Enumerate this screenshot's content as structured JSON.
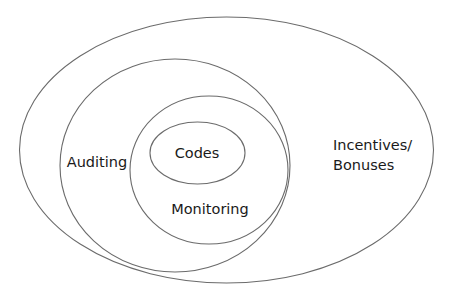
{
  "diagram": {
    "type": "nested-ellipses",
    "layers": [
      {
        "id": "incentives",
        "label_lines": [
          "Incentives/",
          "Bonuses"
        ]
      },
      {
        "id": "auditing",
        "label_lines": [
          "Auditing"
        ]
      },
      {
        "id": "monitoring",
        "label_lines": [
          "Monitoring"
        ]
      },
      {
        "id": "codes",
        "label_lines": [
          "Codes"
        ]
      }
    ],
    "colors": {
      "stroke": "#6b6b6b",
      "text": "#1a1a1a",
      "background": "#ffffff"
    }
  }
}
